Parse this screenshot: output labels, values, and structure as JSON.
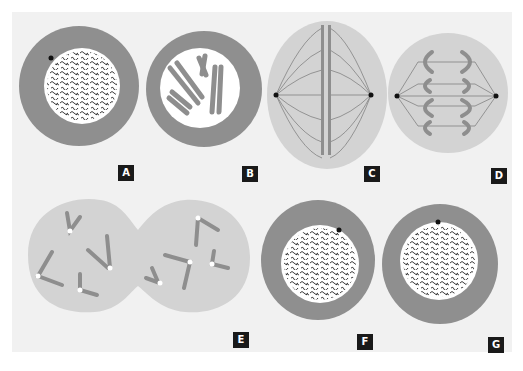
{
  "figure": {
    "colors": {
      "background": "#f1f1f1",
      "cytoplasm_ring": "#8f8f8f",
      "nucleus": "#ffffff",
      "spindle_cell": "#d3d3d3",
      "chromosome": "#8e8e8e",
      "label_bg": "#1a1a1a",
      "label_text": "#ffffff"
    },
    "panels": [
      {
        "id": "A",
        "label": "A",
        "stage": "interphase (chromatin in nucleus)"
      },
      {
        "id": "B",
        "label": "B",
        "stage": "prophase (condensed chromosomes)"
      },
      {
        "id": "C",
        "label": "C",
        "stage": "metaphase (spindle, chromosomes aligned)"
      },
      {
        "id": "D",
        "label": "D",
        "stage": "anaphase (chromatids separating)"
      },
      {
        "id": "E",
        "label": "E",
        "stage": "telophase (cell pinching into two)"
      },
      {
        "id": "F",
        "label": "F",
        "stage": "daughter cell interphase"
      },
      {
        "id": "G",
        "label": "G",
        "stage": "daughter cell interphase"
      }
    ]
  }
}
